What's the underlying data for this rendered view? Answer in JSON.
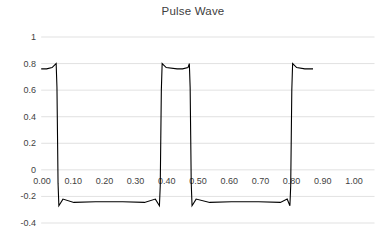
{
  "chart_data": {
    "type": "line",
    "title": "Pulse Wave",
    "xlabel": "",
    "ylabel": "",
    "xlim": [
      0.0,
      1.0
    ],
    "ylim": [
      -0.4,
      1.0
    ],
    "grid": true,
    "legend": false,
    "legend_position": "none",
    "line_color": "#000000",
    "grid_color": "#d9d9d9",
    "background_color": "#ffffff",
    "text_color": "#3f3f3f",
    "y_ticks": [
      "1",
      "0.8",
      "0.6",
      "0.4",
      "0.2",
      "0",
      "-0.2",
      "-0.4"
    ],
    "y_tick_values": [
      1,
      0.8,
      0.6,
      0.4,
      0.2,
      0,
      -0.2,
      -0.4
    ],
    "x_ticks": [
      "0.00",
      "0.10",
      "0.20",
      "0.30",
      "0.40",
      "0.50",
      "0.60",
      "0.70",
      "0.80",
      "0.90",
      "1.00"
    ],
    "x_tick_values": [
      0.0,
      0.1,
      0.2,
      0.3,
      0.4,
      0.5,
      0.6,
      0.7,
      0.8,
      0.9,
      1.0
    ],
    "high_level": 0.76,
    "low_level": -0.24,
    "transitions": [
      0.06,
      0.44,
      0.55,
      0.92
    ],
    "x": [
      0.0,
      0.02,
      0.04,
      0.055,
      0.058,
      0.06,
      0.062,
      0.065,
      0.08,
      0.12,
      0.2,
      0.3,
      0.38,
      0.42,
      0.435,
      0.438,
      0.44,
      0.442,
      0.445,
      0.46,
      0.5,
      0.52,
      0.54,
      0.545,
      0.548,
      0.55,
      0.552,
      0.555,
      0.57,
      0.62,
      0.7,
      0.8,
      0.88,
      0.905,
      0.915,
      0.918,
      0.92,
      0.922,
      0.925,
      0.94,
      0.97,
      1.0
    ],
    "y": [
      0.76,
      0.76,
      0.77,
      0.8,
      0.62,
      0.26,
      -0.1,
      -0.27,
      -0.22,
      -0.245,
      -0.24,
      -0.24,
      -0.245,
      -0.22,
      -0.27,
      -0.12,
      0.24,
      0.6,
      0.8,
      0.77,
      0.76,
      0.76,
      0.77,
      0.8,
      0.62,
      0.26,
      -0.1,
      -0.27,
      -0.22,
      -0.245,
      -0.24,
      -0.24,
      -0.245,
      -0.22,
      -0.27,
      -0.12,
      0.24,
      0.6,
      0.8,
      0.77,
      0.76,
      0.76
    ]
  }
}
